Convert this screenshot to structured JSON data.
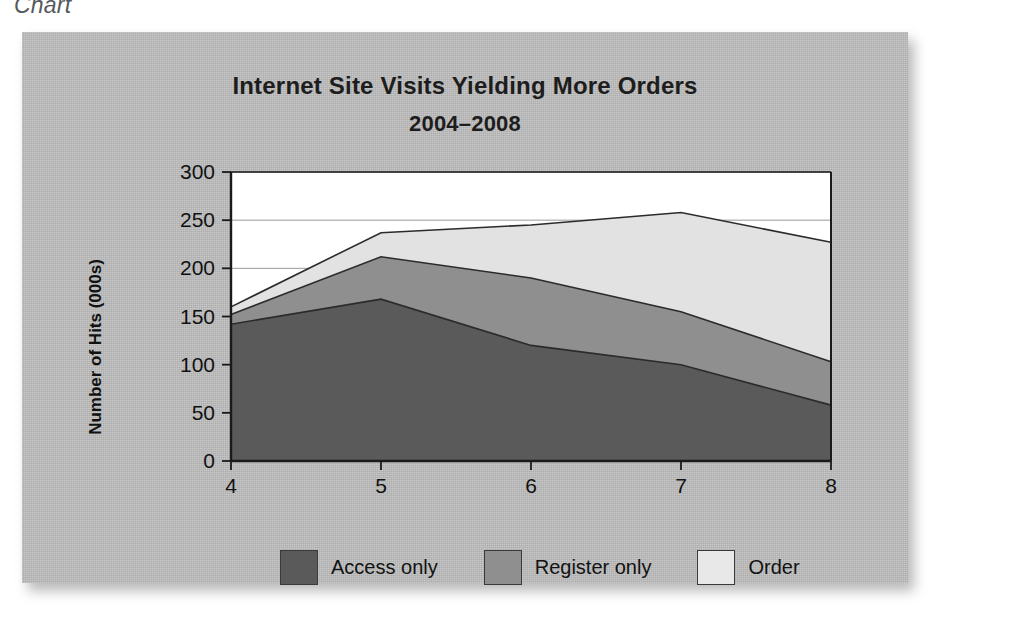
{
  "caption": "Chart",
  "chart_data": {
    "type": "area",
    "title": "Internet Site Visits Yielding More Orders",
    "subtitle": "2004–2008",
    "xlabel": "",
    "ylabel": "Number of Hits (000s)",
    "stacked": true,
    "grid": true,
    "legend_position": "bottom",
    "categories": [
      "4",
      "5",
      "6",
      "7",
      "8"
    ],
    "x_tick_labels": [
      "4",
      "5",
      "6",
      "7",
      "8"
    ],
    "y_tick_labels": [
      "0",
      "50",
      "100",
      "150",
      "200",
      "250",
      "300"
    ],
    "y_ticks": [
      0,
      50,
      100,
      150,
      200,
      250,
      300
    ],
    "ylim": [
      0,
      300
    ],
    "xlim": [
      4,
      8
    ],
    "series": [
      {
        "name": "Access only",
        "color": "#5a5a5a",
        "values": [
          142,
          168,
          120,
          100,
          58
        ]
      },
      {
        "name": "Register only",
        "color": "#8f8f8f",
        "values": [
          10,
          44,
          70,
          55,
          45
        ]
      },
      {
        "name": "Order",
        "color": "#e2e2e2",
        "values": [
          8,
          25,
          55,
          103,
          124
        ]
      }
    ],
    "cumulative": [
      {
        "name": "Access only",
        "totals": [
          142,
          168,
          120,
          100,
          58
        ]
      },
      {
        "name": "Register only",
        "totals": [
          152,
          212,
          190,
          155,
          103
        ]
      },
      {
        "name": "Order",
        "totals": [
          160,
          237,
          245,
          258,
          227
        ]
      }
    ]
  },
  "legend": {
    "items": [
      {
        "label": "Access only",
        "color": "#5a5a5a"
      },
      {
        "label": "Register only",
        "color": "#8f8f8f"
      },
      {
        "label": "Order",
        "color": "#e8e8e8"
      }
    ]
  }
}
